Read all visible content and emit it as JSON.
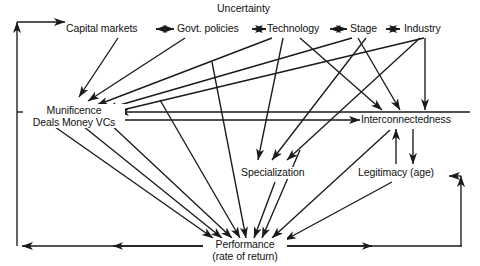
{
  "diagram": {
    "title": "Uncertainty",
    "type": "causal-path-diagram",
    "stroke_color": "#1a1a1a",
    "background_color": "#ffffff",
    "nodes": [
      {
        "id": "capital_markets",
        "label": "Capital markets",
        "sublabel": "",
        "x": 107,
        "y": 29
      },
      {
        "id": "govt_policies",
        "label": "Govt. policies",
        "sublabel": "",
        "x": 212,
        "y": 29
      },
      {
        "id": "technology",
        "label": "Technology",
        "sublabel": "",
        "x": 297,
        "y": 29
      },
      {
        "id": "stage",
        "label": "Stage",
        "sublabel": "",
        "x": 366,
        "y": 29
      },
      {
        "id": "industry",
        "label": "Industry",
        "sublabel": "",
        "x": 425,
        "y": 29
      },
      {
        "id": "munificence",
        "label": "Munificence",
        "sublabel": "Deals  Money  VCs",
        "x": 72,
        "y": 112
      },
      {
        "id": "interconnectedness",
        "label": "Interconnectedness",
        "sublabel": "",
        "x": 411,
        "y": 120
      },
      {
        "id": "specialization",
        "label": "Specialization",
        "sublabel": "",
        "x": 275,
        "y": 173
      },
      {
        "id": "legitimacy",
        "label": "Legitimacy (age)",
        "sublabel": "",
        "x": 398,
        "y": 173
      },
      {
        "id": "performance",
        "label": "Performance",
        "sublabel": "(rate of return)",
        "x": 243,
        "y": 246
      }
    ],
    "edges": [
      {
        "from": "capital_markets",
        "to": "govt_policies",
        "kind": "bidirectional"
      },
      {
        "from": "govt_policies",
        "to": "technology",
        "kind": "bidirectional"
      },
      {
        "from": "technology",
        "to": "stage",
        "kind": "bidirectional"
      },
      {
        "from": "stage",
        "to": "industry",
        "kind": "bidirectional"
      },
      {
        "from": "capital_markets",
        "to": "munificence",
        "kind": "directed"
      },
      {
        "from": "govt_policies",
        "to": "munificence",
        "kind": "directed"
      },
      {
        "from": "technology",
        "to": "munificence",
        "kind": "directed"
      },
      {
        "from": "stage",
        "to": "munificence",
        "kind": "directed"
      },
      {
        "from": "industry",
        "to": "munificence",
        "kind": "directed"
      },
      {
        "from": "industry",
        "to": "interconnectedness",
        "kind": "directed"
      },
      {
        "from": "stage",
        "to": "interconnectedness",
        "kind": "directed"
      },
      {
        "from": "technology",
        "to": "interconnectedness",
        "kind": "directed"
      },
      {
        "from": "munificence",
        "to": "interconnectedness",
        "kind": "directed"
      },
      {
        "from": "technology",
        "to": "specialization",
        "kind": "directed"
      },
      {
        "from": "stage",
        "to": "specialization",
        "kind": "directed"
      },
      {
        "from": "industry",
        "to": "specialization",
        "kind": "directed"
      },
      {
        "from": "interconnectedness",
        "to": "legitimacy",
        "kind": "bidirectional-parallel"
      },
      {
        "from": "munificence",
        "to": "performance",
        "kind": "directed"
      },
      {
        "from": "specialization",
        "to": "performance",
        "kind": "directed"
      },
      {
        "from": "interconnectedness",
        "to": "performance",
        "kind": "directed"
      },
      {
        "from": "legitimacy",
        "to": "performance",
        "kind": "directed"
      },
      {
        "from": "performance",
        "to": "capital_markets",
        "kind": "feedback-left"
      },
      {
        "from": "performance",
        "to": "munificence",
        "kind": "feedback-left"
      },
      {
        "from": "performance",
        "to": "legitimacy",
        "kind": "feedback-right"
      }
    ]
  }
}
